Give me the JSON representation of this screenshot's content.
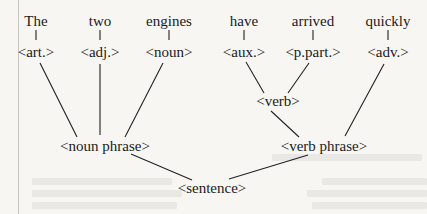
{
  "diagram": {
    "type": "parse-tree",
    "words": [
      {
        "id": "w1",
        "text": "The"
      },
      {
        "id": "w2",
        "text": "two"
      },
      {
        "id": "w3",
        "text": "engines"
      },
      {
        "id": "w4",
        "text": "have"
      },
      {
        "id": "w5",
        "text": "arrived"
      },
      {
        "id": "w6",
        "text": "quickly"
      }
    ],
    "nodes": [
      {
        "id": "art",
        "label": "<art.>"
      },
      {
        "id": "adj",
        "label": "<adj.>"
      },
      {
        "id": "noun",
        "label": "<noun>"
      },
      {
        "id": "aux",
        "label": "<aux.>"
      },
      {
        "id": "ppart",
        "label": "<p.part.>"
      },
      {
        "id": "adv",
        "label": "<adv.>"
      },
      {
        "id": "verb",
        "label": "<verb>"
      },
      {
        "id": "np",
        "label": "<noun phrase>"
      },
      {
        "id": "vp",
        "label": "<verb phrase>"
      },
      {
        "id": "s",
        "label": "<sentence>"
      }
    ],
    "edges": [
      [
        "w1",
        "art"
      ],
      [
        "w2",
        "adj"
      ],
      [
        "w3",
        "noun"
      ],
      [
        "w4",
        "aux"
      ],
      [
        "w5",
        "ppart"
      ],
      [
        "w6",
        "adv"
      ],
      [
        "art",
        "np"
      ],
      [
        "adj",
        "np"
      ],
      [
        "noun",
        "np"
      ],
      [
        "aux",
        "verb"
      ],
      [
        "ppart",
        "verb"
      ],
      [
        "verb",
        "vp"
      ],
      [
        "adv",
        "vp"
      ],
      [
        "np",
        "s"
      ],
      [
        "vp",
        "s"
      ]
    ]
  }
}
